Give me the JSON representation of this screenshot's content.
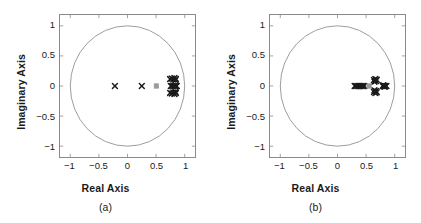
{
  "figure": {
    "width": 421,
    "height": 223,
    "background": "#ffffff"
  },
  "style": {
    "axis_color": "#8a8a8a",
    "circle_color": "#8a8a8a",
    "pole_color": "#1a1a1a",
    "zero_color": "#9a9a9a",
    "text_color": "#1a1a1a"
  },
  "panels": [
    {
      "id": "a",
      "caption": "(a)",
      "xlabel": "Real Axis",
      "ylabel": "Imaginary Axis",
      "xticks": [
        "-1",
        "-0.5",
        "0",
        "0.5",
        "1"
      ],
      "yticks": [
        "1",
        "0.5",
        "0",
        "-0.5",
        "-1"
      ]
    },
    {
      "id": "b",
      "caption": "(b)",
      "xlabel": "Real Axis",
      "ylabel": "Imaginary Axis",
      "xticks": [
        "-1",
        "-0.5",
        "0",
        "0.5",
        "1"
      ],
      "yticks": [
        "1",
        "0.5",
        "0",
        "-0.5",
        "-1"
      ]
    }
  ],
  "chart_data": [
    {
      "type": "scatter",
      "id": "a",
      "title": "(a)",
      "xlabel": "Real Axis",
      "ylabel": "Imaginary Axis",
      "xlim": [
        -1.18,
        1.18
      ],
      "ylim": [
        -1.18,
        1.18
      ],
      "xticks": [
        -1,
        -0.5,
        0,
        0.5,
        1
      ],
      "yticks": [
        -1,
        -0.5,
        0,
        0.5,
        1
      ],
      "xticklabels": [
        "-1",
        "-0.5",
        "0",
        "0.5",
        "1"
      ],
      "yticklabels": [
        "-1",
        "-0.5",
        "0",
        "0.5",
        "1"
      ],
      "grid": false,
      "legend": null,
      "annotations": [
        {
          "kind": "unit-circle",
          "center": [
            0,
            0
          ],
          "radius": 1
        }
      ],
      "series": [
        {
          "name": "poles",
          "marker": "x",
          "color": "#1a1a1a",
          "points": [
            [
              -0.22,
              0.0
            ],
            [
              0.25,
              0.0
            ],
            [
              0.745,
              0.115
            ],
            [
              0.775,
              0.125
            ],
            [
              0.8,
              0.108
            ],
            [
              0.82,
              0.132
            ],
            [
              0.845,
              0.118
            ],
            [
              0.838,
              0.098
            ],
            [
              0.757,
              0.0
            ],
            [
              0.782,
              0.0
            ],
            [
              0.806,
              0.0
            ],
            [
              0.828,
              0.0
            ],
            [
              0.848,
              0.0
            ],
            [
              0.862,
              0.0
            ],
            [
              0.745,
              -0.115
            ],
            [
              0.775,
              -0.126
            ],
            [
              0.8,
              -0.108
            ],
            [
              0.82,
              -0.133
            ],
            [
              0.845,
              -0.118
            ],
            [
              0.838,
              -0.098
            ]
          ]
        },
        {
          "name": "zeros",
          "marker": "square",
          "color": "#9a9a9a",
          "points": [
            [
              0.505,
              0.0
            ]
          ]
        }
      ]
    },
    {
      "type": "scatter",
      "id": "b",
      "title": "(b)",
      "xlabel": "Real Axis",
      "ylabel": "Imaginary Axis",
      "xlim": [
        -1.18,
        1.18
      ],
      "ylim": [
        -1.18,
        1.18
      ],
      "xticks": [
        -1,
        -0.5,
        0,
        0.5,
        1
      ],
      "yticks": [
        -1,
        -0.5,
        0,
        0.5,
        1
      ],
      "xticklabels": [
        "-1",
        "-0.5",
        "0",
        "0.5",
        "1"
      ],
      "yticklabels": [
        "-1",
        "-0.5",
        "0",
        "0.5",
        "1"
      ],
      "grid": false,
      "legend": null,
      "annotations": [
        {
          "kind": "unit-circle",
          "center": [
            0,
            0
          ],
          "radius": 1
        }
      ],
      "series": [
        {
          "name": "poles",
          "marker": "x",
          "color": "#1a1a1a",
          "points": [
            [
              0.3,
              0.0
            ],
            [
              0.325,
              0.0
            ],
            [
              0.35,
              0.0
            ],
            [
              0.375,
              0.0
            ],
            [
              0.4,
              0.0
            ],
            [
              0.424,
              0.0
            ],
            [
              0.448,
              0.0
            ],
            [
              0.47,
              0.0
            ],
            [
              0.638,
              0.1
            ],
            [
              0.662,
              0.118
            ],
            [
              0.686,
              0.102
            ],
            [
              0.645,
              0.072
            ],
            [
              0.672,
              0.082
            ],
            [
              0.638,
              -0.1
            ],
            [
              0.662,
              -0.118
            ],
            [
              0.686,
              -0.102
            ],
            [
              0.645,
              -0.072
            ],
            [
              0.672,
              -0.082
            ],
            [
              0.79,
              0.0
            ],
            [
              0.812,
              0.0
            ],
            [
              0.834,
              0.0
            ],
            [
              0.856,
              0.0
            ],
            [
              0.8,
              0.012
            ],
            [
              0.824,
              -0.012
            ]
          ]
        },
        {
          "name": "zeros",
          "marker": "square",
          "color": "#9a9a9a",
          "points": [
            [
              0.552,
              0.0
            ]
          ]
        }
      ]
    }
  ]
}
